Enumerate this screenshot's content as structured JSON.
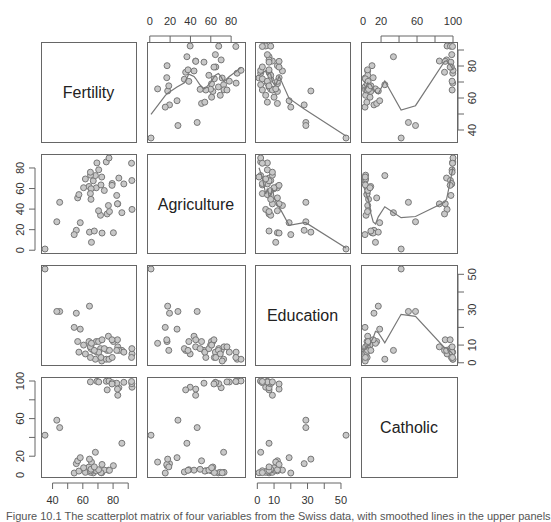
{
  "chart_data": {
    "type": "scatter",
    "subtype": "scatterplot-matrix",
    "variables": [
      "Fertility",
      "Agriculture",
      "Education",
      "Catholic"
    ],
    "ranges": {
      "Fertility": [
        35,
        92.5
      ],
      "Agriculture": [
        1.2,
        89.7
      ],
      "Education": [
        1,
        53
      ],
      "Catholic": [
        2.15,
        100
      ]
    },
    "ticks": {
      "Fertility": [
        40,
        60,
        80
      ],
      "Agriculture": [
        0,
        20,
        40,
        60,
        80
      ],
      "Education": [
        0,
        10,
        30,
        50
      ],
      "Catholic": [
        0,
        20,
        60,
        100
      ]
    },
    "minor_ticks": {
      "Fertility": [
        40,
        50,
        60,
        70,
        80,
        90
      ],
      "Agriculture": [
        0,
        20,
        40,
        60,
        80
      ],
      "Education": [
        0,
        10,
        20,
        30,
        40,
        50
      ],
      "Catholic": [
        0,
        20,
        40,
        60,
        80,
        100
      ]
    },
    "top_axis_labels": {
      "Agriculture": [
        0,
        20,
        40,
        60,
        80
      ],
      "Catholic": [
        0,
        20,
        60,
        100
      ]
    },
    "right_axis_labels": {
      "Fertility": [
        40,
        60,
        80
      ],
      "Education": [
        0,
        10,
        30,
        50
      ]
    },
    "left_axis_labels": {
      "Agriculture": [
        0,
        20,
        40,
        60,
        80
      ],
      "Catholic": [
        0,
        20,
        60,
        100
      ]
    },
    "bottom_axis_labels": {
      "Fertility": [
        40,
        60,
        80
      ],
      "Education": [
        0,
        10,
        30,
        50
      ]
    },
    "smoother_panels": "upper",
    "data": {
      "Fertility": [
        80.2,
        83.1,
        92.5,
        85.8,
        76.9,
        76.1,
        83.8,
        92.4,
        82.4,
        82.9,
        87.1,
        64.1,
        66.9,
        68.9,
        61.7,
        68.3,
        71.7,
        55.7,
        54.3,
        65.1,
        65.5,
        65,
        56.6,
        57.4,
        72.5,
        74.2,
        72,
        60.5,
        58.3,
        65.4,
        75.5,
        69.3,
        77.3,
        70.5,
        79.4,
        65,
        92.2,
        79.3,
        70.4,
        65.7,
        72.7,
        64.4,
        77.6,
        67.6,
        35,
        44.7,
        42.8
      ],
      "Agriculture": [
        17,
        45.1,
        39.7,
        36.5,
        43.5,
        35.3,
        70.2,
        67.8,
        53.3,
        45.2,
        64.5,
        62,
        67.5,
        60.7,
        69.3,
        72.6,
        34,
        19.4,
        15.2,
        73,
        59.8,
        55.1,
        50.9,
        54.1,
        71.2,
        58.1,
        63.5,
        60.8,
        26.8,
        49.5,
        85.9,
        84.9,
        89.7,
        78.2,
        64.9,
        75.9,
        84.6,
        63.1,
        38.4,
        7.7,
        16.7,
        17.6,
        37.6,
        18.7,
        1.2,
        46.6,
        27.7
      ],
      "Education": [
        12,
        9,
        5,
        7,
        15,
        7,
        7,
        8,
        7,
        13,
        6,
        12,
        7,
        12,
        5,
        2,
        8,
        28,
        20,
        9,
        10,
        3,
        12,
        6,
        1,
        8,
        3,
        10,
        19,
        8,
        2,
        6,
        2,
        6,
        3,
        9,
        3,
        13,
        12,
        11,
        13,
        32,
        7,
        7,
        53,
        29,
        29
      ],
      "Catholic": [
        9.96,
        84.84,
        93.4,
        33.77,
        5.16,
        90.57,
        92.85,
        97.16,
        97.67,
        91.38,
        98.61,
        8.52,
        2.27,
        4.43,
        2.82,
        24.2,
        3.3,
        12.11,
        2.15,
        2.84,
        5.23,
        4.52,
        15.14,
        4.2,
        2.4,
        5.23,
        2.56,
        7.72,
        18.46,
        6.1,
        99.71,
        99.68,
        100,
        98.96,
        98.22,
        99.06,
        99.46,
        96.83,
        5.62,
        13.79,
        11.22,
        16.92,
        4.97,
        8.65,
        42.34,
        50.43,
        58.33
      ]
    },
    "title": "",
    "xlabel": "",
    "ylabel": "",
    "grid": false,
    "legend": null
  },
  "diagonal_labels": [
    "Fertility",
    "Agriculture",
    "Education",
    "Catholic"
  ],
  "caption": "Figure 10.1 The scatterplot matrix of four variables from the Swiss data, with smoothed lines in the upper panels"
}
